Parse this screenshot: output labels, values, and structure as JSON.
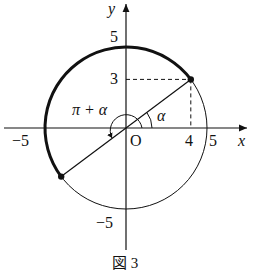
{
  "figure": {
    "caption": "図 3",
    "axes": {
      "x_label": "x",
      "y_label": "y",
      "origin_label": "O"
    },
    "ticks": {
      "x_pos": "5",
      "x_neg": "−5",
      "y_pos": "5",
      "y_neg": "−5",
      "x_point": "4",
      "y_point": "3"
    },
    "angles": {
      "alpha": "α",
      "pi_plus_alpha": "π + α"
    },
    "circle": {
      "radius": 5,
      "center": [
        0,
        0
      ]
    },
    "points": [
      {
        "name": "P",
        "coords": [
          4,
          3
        ]
      },
      {
        "name": "Q",
        "coords": [
          -4,
          -3
        ]
      }
    ],
    "highlighted_arc": {
      "from": [
        4,
        3
      ],
      "to": [
        -4,
        -3
      ],
      "direction": "counterclockwise"
    },
    "colors": {
      "ink": "#111111",
      "background": "#ffffff"
    }
  }
}
